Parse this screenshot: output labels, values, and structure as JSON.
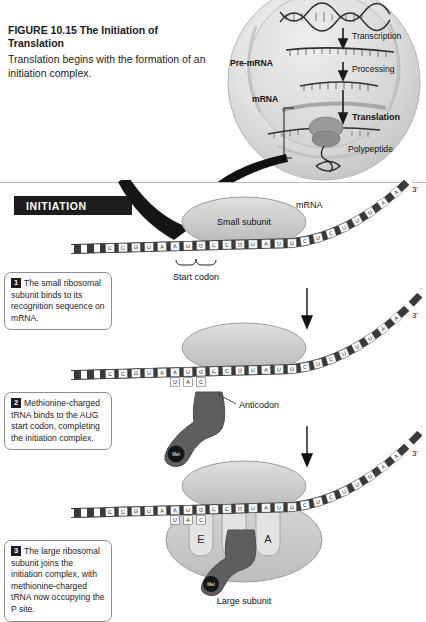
{
  "figure": {
    "title": "FIGURE 10.15  The Initiation of Translation",
    "subtitle": "Translation begins with the formation of an initiation complex."
  },
  "cell_diagram": {
    "labels": {
      "dna": "DNA",
      "transcription": "Transcription",
      "pre_mrna": "Pre-mRNA",
      "processing": "Processing",
      "mrna": "mRNA",
      "translation": "Translation",
      "polypeptide": "Polypeptide"
    }
  },
  "banner": {
    "label": "INITIATION"
  },
  "callouts": [
    {
      "number": "1",
      "text": "The small ribosomal subunit binds to its recognition sequence on mRNA."
    },
    {
      "number": "2",
      "text": "Methionine-charged tRNA binds to the AUG start codon, completing the initiation complex."
    },
    {
      "number": "3",
      "text": "The large ribosomal subunit joins the initiation complex, with methionine-charged tRNA now occupying the P site."
    }
  ],
  "mrna": {
    "sequence": [
      "C",
      "C",
      "G",
      "U",
      "A",
      "A",
      "U",
      "G",
      "C",
      "C",
      "G",
      "U",
      "A",
      "U",
      "G",
      "C",
      "U",
      "C",
      "U",
      "U",
      "U",
      "A",
      "A"
    ],
    "five_prime": "5'",
    "three_prime": "3'",
    "label": "mRNA",
    "start_codon_label": "Start codon",
    "start_codon_bases": [
      "A",
      "U",
      "G"
    ],
    "start_codon_index": 5
  },
  "trna": {
    "anticodon_label": "Anticodon",
    "anticodon_bases": [
      "U",
      "A",
      "C"
    ],
    "amino_acid": "Met"
  },
  "ribosome": {
    "small_subunit_label": "Small subunit",
    "large_subunit_label": "Large subunit",
    "sites": [
      "E",
      "P",
      "A"
    ]
  },
  "colors": {
    "banner_bg": "#1c1c1c",
    "subunit_fill": "#cfcfcf",
    "mrna_fill": "#3a3a3a",
    "trna_fill": "#5a5a5a",
    "callout_border": "#8d8d8d"
  }
}
